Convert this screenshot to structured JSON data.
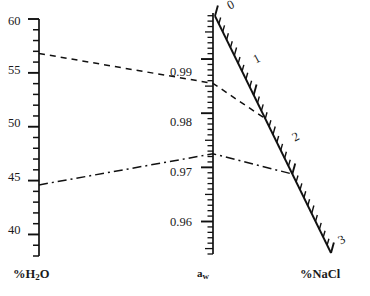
{
  "chart_data": {
    "type": "line",
    "title": "",
    "subtitle": "",
    "axes": [
      {
        "id": "h2o",
        "name": "h2o-axis",
        "caption": "%H",
        "caption_sub": "2",
        "caption_tail": "O",
        "orientation": "vertical",
        "range": [
          38,
          60
        ],
        "major_ticks": [
          60,
          55,
          50,
          45,
          40
        ],
        "major_labels": [
          "60",
          "55",
          "50",
          "45",
          "40"
        ],
        "minor_step": 1,
        "tick_side": "left",
        "grid": false
      },
      {
        "id": "aw",
        "name": "aw-axis",
        "caption": "a",
        "caption_sub": "w",
        "orientation": "vertical",
        "range": [
          0.954,
          0.9985
        ],
        "major_ticks": [
          0.99,
          0.98,
          0.97,
          0.96
        ],
        "major_labels": [
          "0.99",
          "0.98",
          "0.97",
          "0.96"
        ],
        "minor_step": 0.001,
        "tick_side": "left",
        "grid": false
      },
      {
        "id": "nacl",
        "name": "nacl-axis",
        "caption": "%NaCl",
        "orientation": "diagonal",
        "range": [
          0,
          3
        ],
        "major_ticks": [
          0,
          1,
          2,
          3
        ],
        "major_labels": [
          "0",
          "1",
          "2",
          "3"
        ],
        "minor_step": 0.1,
        "tick_side": "right",
        "grid": false
      }
    ],
    "alignment_lines": [
      {
        "name": "upper-alignment-line",
        "style": "dashed",
        "points": [
          {
            "axis": "h2o",
            "value": 56.8
          },
          {
            "axis": "aw",
            "value": 0.9855
          },
          {
            "axis": "nacl",
            "value": 1.3
          }
        ]
      },
      {
        "name": "lower-alignment-line",
        "style": "dash-dot",
        "points": [
          {
            "axis": "h2o",
            "value": 44.6
          },
          {
            "axis": "aw",
            "value": 0.9725
          },
          {
            "axis": "nacl",
            "value": 2.0
          }
        ]
      }
    ],
    "legend": [],
    "annotations": [],
    "ylim": [
      0,
      0
    ],
    "xlabel": "",
    "ylabel": "",
    "colors": {
      "ink": "#111111",
      "background": "#ffffff"
    }
  },
  "labels": {
    "h2o_ticks": [
      {
        "text": "60",
        "x": 8,
        "y": 15
      },
      {
        "text": "55",
        "x": 8,
        "y": 64
      },
      {
        "text": "50",
        "x": 8,
        "y": 117
      },
      {
        "text": "45",
        "x": 8,
        "y": 171
      },
      {
        "text": "40",
        "x": 8,
        "y": 224
      }
    ],
    "aw_ticks": [
      {
        "text": "0.99",
        "x": 170,
        "y": 66
      },
      {
        "text": "0.98",
        "x": 170,
        "y": 116
      },
      {
        "text": "0.97",
        "x": 170,
        "y": 166
      },
      {
        "text": "0.96",
        "x": 170,
        "y": 216
      }
    ],
    "nacl_ticks": [
      {
        "text": "0",
        "x": 225,
        "y": 1,
        "rot": -28
      },
      {
        "text": "1",
        "x": 251,
        "y": 55,
        "rot": -28
      },
      {
        "text": "2",
        "x": 290,
        "y": 133,
        "rot": -28
      },
      {
        "text": "3",
        "x": 336,
        "y": 236,
        "rot": -28
      }
    ],
    "captions": {
      "h2o": {
        "x": 13,
        "y": 268
      },
      "aw": {
        "x": 197,
        "y": 268
      },
      "nacl": {
        "x": 300,
        "y": 268
      }
    }
  },
  "caption_text": {
    "h2o_pct": "%H",
    "h2o_sub": "2",
    "h2o_tail": "O",
    "aw_main": "a",
    "aw_sub": "w",
    "nacl": "%NaCl"
  }
}
